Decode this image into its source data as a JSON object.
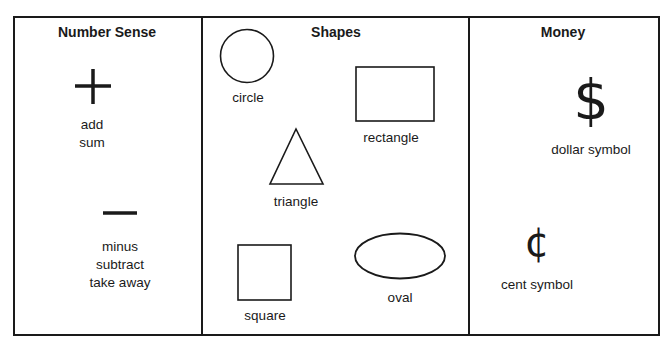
{
  "sections": {
    "number_sense": {
      "heading": "Number Sense",
      "items": [
        {
          "symbol": "+",
          "icon": "plus-icon",
          "labels": [
            "add",
            "sum"
          ]
        },
        {
          "symbol": "−",
          "icon": "minus-icon",
          "labels": [
            "minus",
            "subtract",
            "take away"
          ]
        }
      ]
    },
    "shapes": {
      "heading": "Shapes",
      "items": [
        {
          "shape": "circle",
          "label": "circle"
        },
        {
          "shape": "rectangle",
          "label": "rectangle"
        },
        {
          "shape": "triangle",
          "label": "triangle"
        },
        {
          "shape": "square",
          "label": "square"
        },
        {
          "shape": "oval",
          "label": "oval"
        }
      ]
    },
    "money": {
      "heading": "Money",
      "items": [
        {
          "symbol": "$",
          "icon": "dollar-icon",
          "label": "dollar symbol"
        },
        {
          "symbol": "¢",
          "icon": "cent-icon",
          "label": "cent symbol"
        }
      ]
    }
  },
  "colors": {
    "ink": "#1a1a1a",
    "background": "#ffffff"
  }
}
